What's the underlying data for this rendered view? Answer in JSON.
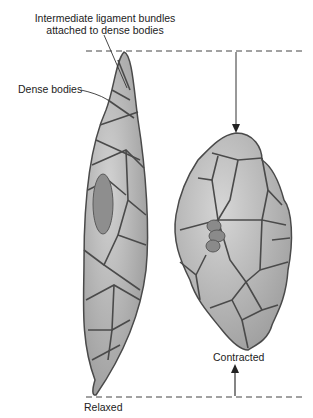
{
  "figure": {
    "labels": {
      "ligament_bundles_line1": "Intermediate ligament bundles",
      "ligament_bundles_line2": "attached to dense bodies",
      "dense_bodies": "Dense bodies",
      "contracted": "Contracted",
      "relaxed": "Relaxed"
    },
    "colors": {
      "cell_fill": "#a8a8a8",
      "cell_light": "#c8c8c8",
      "outline": "#4a4a4a",
      "nucleus": "#8e8e8e",
      "text": "#222222"
    }
  }
}
